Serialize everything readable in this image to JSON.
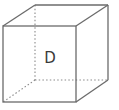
{
  "diagram": {
    "type": "cube",
    "face_label": "D",
    "colors": {
      "edge": "#6b6b6b",
      "hidden_edge": "#8a8a8a",
      "label": "#3a3a3a",
      "background": "#ffffff"
    }
  }
}
